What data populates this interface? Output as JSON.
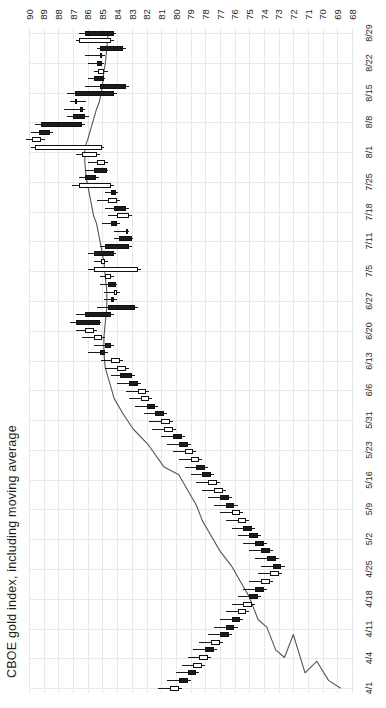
{
  "chart": {
    "title": "CBOE gold index, including moving average",
    "orientation": "rotated-90",
    "axis_line_color": "#e9e9e9",
    "candle_up_color": "#ffffff",
    "candle_down_color": "#1b1b1b",
    "candle_border_color": "#111111",
    "ma_line_color": "#555555"
  },
  "chart_data": {
    "type": "line",
    "subtype": "candlestick-with-moving-average",
    "title": "CBOE gold index, including moving average",
    "xlabel": "",
    "ylabel": "",
    "grid": true,
    "legend": "none",
    "price_axis": {
      "position": "top",
      "direction": "descending-left-to-right",
      "min": 68,
      "max": 90,
      "ticks": [
        90,
        89,
        88,
        87,
        86,
        85,
        84,
        83,
        82,
        81,
        80,
        79,
        78,
        77,
        76,
        75,
        74,
        73,
        72,
        71,
        70,
        69,
        68
      ]
    },
    "date_axis": {
      "position": "right",
      "direction": "descending-top-to-bottom",
      "ticks": [
        "8/29",
        "8/22",
        "8/15",
        "8/8",
        "8/1",
        "7/25",
        "7/18",
        "7/11",
        "7/5",
        "6/27",
        "6/20",
        "6/13",
        "6/6",
        "5/31",
        "5/23",
        "5/16",
        "5/9",
        "5/2",
        "4/25",
        "4/18",
        "4/11",
        "4/4",
        "4/1"
      ]
    },
    "ohlc": [
      {
        "date": "8/29",
        "open": 86.2,
        "high": 86.6,
        "low": 84.1,
        "close": 84.2,
        "dir": "down"
      },
      {
        "date": "8/28",
        "open": 84.4,
        "high": 86.8,
        "low": 84.2,
        "close": 86.6,
        "dir": "up"
      },
      {
        "date": "8/27",
        "open": 85.2,
        "high": 85.4,
        "low": 83.4,
        "close": 83.6,
        "dir": "down"
      },
      {
        "date": "8/26",
        "open": 85.1,
        "high": 86.2,
        "low": 84.8,
        "close": 85.2,
        "dir": "down"
      },
      {
        "date": "8/25",
        "open": 85.4,
        "high": 86.0,
        "low": 84.9,
        "close": 85.0,
        "dir": "down"
      },
      {
        "date": "8/22",
        "open": 84.9,
        "high": 85.6,
        "low": 84.6,
        "close": 85.3,
        "dir": "up"
      },
      {
        "date": "8/21",
        "open": 85.6,
        "high": 86.0,
        "low": 84.8,
        "close": 84.9,
        "dir": "down"
      },
      {
        "date": "8/20",
        "open": 85.2,
        "high": 86.2,
        "low": 83.2,
        "close": 83.4,
        "dir": "down"
      },
      {
        "date": "8/19",
        "open": 86.9,
        "high": 87.4,
        "low": 84.0,
        "close": 84.2,
        "dir": "down"
      },
      {
        "date": "8/18",
        "open": 86.8,
        "high": 87.2,
        "low": 86.1,
        "close": 86.9,
        "dir": "up"
      },
      {
        "date": "8/15",
        "open": 86.4,
        "high": 87.6,
        "low": 86.2,
        "close": 86.5,
        "dir": "down"
      },
      {
        "date": "8/14",
        "open": 87.0,
        "high": 87.4,
        "low": 85.9,
        "close": 86.2,
        "dir": "down"
      },
      {
        "date": "8/13",
        "open": 89.2,
        "high": 89.6,
        "low": 86.2,
        "close": 86.4,
        "dir": "down"
      },
      {
        "date": "8/12",
        "open": 89.3,
        "high": 89.9,
        "low": 88.4,
        "close": 88.6,
        "dir": "down"
      },
      {
        "date": "8/11",
        "open": 89.8,
        "high": 90.2,
        "low": 88.9,
        "close": 89.2,
        "dir": "up"
      },
      {
        "date": "8/8",
        "open": 89.6,
        "high": 89.9,
        "low": 84.9,
        "close": 85.0,
        "dir": "up"
      },
      {
        "date": "8/7",
        "open": 86.4,
        "high": 86.8,
        "low": 85.2,
        "close": 85.4,
        "dir": "up"
      },
      {
        "date": "8/6",
        "open": 85.4,
        "high": 86.0,
        "low": 84.6,
        "close": 84.8,
        "dir": "up"
      },
      {
        "date": "8/5",
        "open": 85.6,
        "high": 86.2,
        "low": 84.6,
        "close": 84.7,
        "dir": "down"
      },
      {
        "date": "8/4",
        "open": 86.2,
        "high": 86.6,
        "low": 85.2,
        "close": 85.4,
        "dir": "down"
      },
      {
        "date": "8/1",
        "open": 86.6,
        "high": 87.1,
        "low": 84.2,
        "close": 84.4,
        "dir": "up"
      },
      {
        "date": "7/31",
        "open": 84.4,
        "high": 84.8,
        "low": 83.9,
        "close": 84.1,
        "dir": "down"
      },
      {
        "date": "7/30",
        "open": 84.6,
        "high": 85.4,
        "low": 83.8,
        "close": 84.0,
        "dir": "up"
      },
      {
        "date": "7/29",
        "open": 84.2,
        "high": 84.8,
        "low": 83.2,
        "close": 83.4,
        "dir": "down"
      },
      {
        "date": "7/28",
        "open": 84.0,
        "high": 84.6,
        "low": 83.0,
        "close": 83.2,
        "dir": "up"
      },
      {
        "date": "7/25",
        "open": 84.4,
        "high": 85.0,
        "low": 83.8,
        "close": 84.0,
        "dir": "down"
      },
      {
        "date": "7/24",
        "open": 83.4,
        "high": 84.2,
        "low": 83.2,
        "close": 83.4,
        "dir": "up"
      },
      {
        "date": "7/23",
        "open": 83.9,
        "high": 84.2,
        "low": 82.9,
        "close": 83.0,
        "dir": "down"
      },
      {
        "date": "7/22",
        "open": 84.8,
        "high": 85.2,
        "low": 83.0,
        "close": 83.2,
        "dir": "down"
      },
      {
        "date": "7/21",
        "open": 85.6,
        "high": 86.0,
        "low": 84.1,
        "close": 84.2,
        "dir": "down"
      },
      {
        "date": "7/18",
        "open": 85.1,
        "high": 85.6,
        "low": 84.6,
        "close": 84.8,
        "dir": "up"
      },
      {
        "date": "7/17",
        "open": 85.6,
        "high": 86.0,
        "low": 82.4,
        "close": 82.6,
        "dir": "up"
      },
      {
        "date": "7/16",
        "open": 84.8,
        "high": 85.2,
        "low": 84.2,
        "close": 84.4,
        "dir": "up"
      },
      {
        "date": "7/15",
        "open": 84.6,
        "high": 85.2,
        "low": 84.0,
        "close": 84.1,
        "dir": "down"
      },
      {
        "date": "7/11",
        "open": 84.2,
        "high": 84.9,
        "low": 83.8,
        "close": 84.0,
        "dir": "up"
      },
      {
        "date": "7/10",
        "open": 84.4,
        "high": 84.9,
        "low": 84.0,
        "close": 84.2,
        "dir": "down"
      },
      {
        "date": "7/9",
        "open": 84.6,
        "high": 85.4,
        "low": 82.6,
        "close": 82.8,
        "dir": "down"
      },
      {
        "date": "7/8",
        "open": 86.2,
        "high": 86.8,
        "low": 84.2,
        "close": 84.4,
        "dir": "down"
      },
      {
        "date": "7/5",
        "open": 86.8,
        "high": 87.2,
        "low": 85.1,
        "close": 85.2,
        "dir": "down"
      },
      {
        "date": "7/3",
        "open": 86.2,
        "high": 86.8,
        "low": 85.4,
        "close": 85.6,
        "dir": "up"
      },
      {
        "date": "7/2",
        "open": 85.6,
        "high": 86.4,
        "low": 84.8,
        "close": 85.0,
        "dir": "up"
      },
      {
        "date": "7/1",
        "open": 84.8,
        "high": 85.6,
        "low": 84.2,
        "close": 84.4,
        "dir": "down"
      },
      {
        "date": "6/27",
        "open": 85.2,
        "high": 86.0,
        "low": 84.6,
        "close": 84.8,
        "dir": "down"
      },
      {
        "date": "6/26",
        "open": 84.4,
        "high": 85.1,
        "low": 83.6,
        "close": 83.8,
        "dir": "up"
      },
      {
        "date": "6/25",
        "open": 84.0,
        "high": 84.8,
        "low": 83.2,
        "close": 83.4,
        "dir": "up"
      },
      {
        "date": "6/24",
        "open": 83.8,
        "high": 84.4,
        "low": 82.8,
        "close": 83.0,
        "dir": "down"
      },
      {
        "date": "6/20",
        "open": 83.2,
        "high": 84.0,
        "low": 82.4,
        "close": 82.6,
        "dir": "down"
      },
      {
        "date": "6/19",
        "open": 82.6,
        "high": 83.4,
        "low": 81.8,
        "close": 82.0,
        "dir": "up"
      },
      {
        "date": "6/18",
        "open": 82.4,
        "high": 83.2,
        "low": 81.6,
        "close": 81.8,
        "dir": "up"
      },
      {
        "date": "6/17",
        "open": 82.0,
        "high": 82.8,
        "low": 81.2,
        "close": 81.4,
        "dir": "down"
      },
      {
        "date": "6/13",
        "open": 81.4,
        "high": 82.2,
        "low": 80.6,
        "close": 80.8,
        "dir": "down"
      },
      {
        "date": "6/12",
        "open": 81.0,
        "high": 81.8,
        "low": 80.2,
        "close": 80.4,
        "dir": "up"
      },
      {
        "date": "6/11",
        "open": 80.8,
        "high": 81.6,
        "low": 80.0,
        "close": 80.2,
        "dir": "up"
      },
      {
        "date": "6/10",
        "open": 80.2,
        "high": 81.0,
        "low": 79.4,
        "close": 79.6,
        "dir": "down"
      },
      {
        "date": "6/6",
        "open": 79.8,
        "high": 80.6,
        "low": 79.0,
        "close": 79.2,
        "dir": "down"
      },
      {
        "date": "6/5",
        "open": 79.4,
        "high": 80.2,
        "low": 78.6,
        "close": 78.8,
        "dir": "up"
      },
      {
        "date": "6/4",
        "open": 79.0,
        "high": 79.8,
        "low": 78.2,
        "close": 78.4,
        "dir": "up"
      },
      {
        "date": "6/3",
        "open": 78.6,
        "high": 79.4,
        "low": 77.8,
        "close": 78.0,
        "dir": "down"
      },
      {
        "date": "5/31",
        "open": 78.2,
        "high": 79.0,
        "low": 77.4,
        "close": 77.6,
        "dir": "down"
      },
      {
        "date": "5/30",
        "open": 77.8,
        "high": 78.6,
        "low": 77.0,
        "close": 77.2,
        "dir": "up"
      },
      {
        "date": "5/29",
        "open": 77.4,
        "high": 78.2,
        "low": 76.6,
        "close": 76.8,
        "dir": "up"
      },
      {
        "date": "5/28",
        "open": 77.0,
        "high": 77.8,
        "low": 76.2,
        "close": 76.4,
        "dir": "down"
      },
      {
        "date": "5/23",
        "open": 76.6,
        "high": 77.4,
        "low": 75.8,
        "close": 76.0,
        "dir": "down"
      },
      {
        "date": "5/22",
        "open": 76.2,
        "high": 77.0,
        "low": 75.4,
        "close": 75.6,
        "dir": "up"
      },
      {
        "date": "5/21",
        "open": 75.8,
        "high": 76.6,
        "low": 75.0,
        "close": 75.2,
        "dir": "up"
      },
      {
        "date": "5/20",
        "open": 75.4,
        "high": 76.2,
        "low": 74.6,
        "close": 74.8,
        "dir": "down"
      },
      {
        "date": "5/16",
        "open": 75.0,
        "high": 75.8,
        "low": 74.2,
        "close": 74.4,
        "dir": "down"
      },
      {
        "date": "5/15",
        "open": 74.6,
        "high": 75.4,
        "low": 73.8,
        "close": 74.0,
        "dir": "down"
      },
      {
        "date": "5/14",
        "open": 74.2,
        "high": 75.0,
        "low": 73.4,
        "close": 73.6,
        "dir": "down"
      },
      {
        "date": "5/13",
        "open": 73.8,
        "high": 74.6,
        "low": 73.0,
        "close": 73.2,
        "dir": "down"
      },
      {
        "date": "5/9",
        "open": 73.4,
        "high": 74.2,
        "low": 72.6,
        "close": 72.8,
        "dir": "down"
      },
      {
        "date": "5/8",
        "open": 73.6,
        "high": 74.4,
        "low": 72.8,
        "close": 73.0,
        "dir": "up"
      },
      {
        "date": "5/7",
        "open": 74.2,
        "high": 75.0,
        "low": 73.4,
        "close": 73.6,
        "dir": "up"
      },
      {
        "date": "5/6",
        "open": 74.6,
        "high": 75.4,
        "low": 73.8,
        "close": 74.0,
        "dir": "down"
      },
      {
        "date": "5/2",
        "open": 75.0,
        "high": 75.8,
        "low": 74.2,
        "close": 74.4,
        "dir": "down"
      },
      {
        "date": "5/1",
        "open": 75.4,
        "high": 76.2,
        "low": 74.6,
        "close": 74.8,
        "dir": "up"
      },
      {
        "date": "4/30",
        "open": 75.8,
        "high": 76.6,
        "low": 75.0,
        "close": 75.2,
        "dir": "up"
      },
      {
        "date": "4/29",
        "open": 76.2,
        "high": 77.0,
        "low": 75.4,
        "close": 75.6,
        "dir": "down"
      },
      {
        "date": "4/25",
        "open": 76.6,
        "high": 77.4,
        "low": 75.8,
        "close": 76.0,
        "dir": "down"
      },
      {
        "date": "4/24",
        "open": 77.0,
        "high": 77.8,
        "low": 76.2,
        "close": 76.4,
        "dir": "down"
      },
      {
        "date": "4/23",
        "open": 77.6,
        "high": 78.4,
        "low": 76.8,
        "close": 77.0,
        "dir": "up"
      },
      {
        "date": "4/22",
        "open": 78.0,
        "high": 78.8,
        "low": 77.2,
        "close": 77.4,
        "dir": "down"
      },
      {
        "date": "4/18",
        "open": 78.4,
        "high": 79.2,
        "low": 77.6,
        "close": 77.8,
        "dir": "up"
      },
      {
        "date": "4/17",
        "open": 78.8,
        "high": 79.6,
        "low": 78.0,
        "close": 78.2,
        "dir": "up"
      },
      {
        "date": "4/11",
        "open": 79.2,
        "high": 80.0,
        "low": 78.4,
        "close": 78.6,
        "dir": "down"
      },
      {
        "date": "4/4",
        "open": 79.8,
        "high": 80.6,
        "low": 79.0,
        "close": 79.2,
        "dir": "down"
      },
      {
        "date": "4/1",
        "open": 80.4,
        "high": 81.2,
        "low": 79.6,
        "close": 79.8,
        "dir": "up"
      }
    ],
    "moving_average": [
      {
        "date": "8/29",
        "value": 84.6
      },
      {
        "date": "8/27",
        "value": 84.7
      },
      {
        "date": "8/25",
        "value": 84.8
      },
      {
        "date": "8/22",
        "value": 84.9
      },
      {
        "date": "8/20",
        "value": 85.0
      },
      {
        "date": "8/18",
        "value": 85.2
      },
      {
        "date": "8/15",
        "value": 85.4
      },
      {
        "date": "8/13",
        "value": 85.7
      },
      {
        "date": "8/11",
        "value": 86.0
      },
      {
        "date": "8/8",
        "value": 86.2
      },
      {
        "date": "8/6",
        "value": 86.2
      },
      {
        "date": "8/4",
        "value": 86.1
      },
      {
        "date": "8/1",
        "value": 86.0
      },
      {
        "date": "7/30",
        "value": 85.8
      },
      {
        "date": "7/28",
        "value": 85.6
      },
      {
        "date": "7/25",
        "value": 85.4
      },
      {
        "date": "7/23",
        "value": 85.2
      },
      {
        "date": "7/21",
        "value": 85.0
      },
      {
        "date": "7/18",
        "value": 84.9
      },
      {
        "date": "7/16",
        "value": 84.8
      },
      {
        "date": "7/11",
        "value": 84.7
      },
      {
        "date": "7/9",
        "value": 84.7
      },
      {
        "date": "7/5",
        "value": 84.8
      },
      {
        "date": "7/2",
        "value": 84.9
      },
      {
        "date": "6/27",
        "value": 84.9
      },
      {
        "date": "6/25",
        "value": 84.8
      },
      {
        "date": "6/20",
        "value": 84.5
      },
      {
        "date": "6/18",
        "value": 84.2
      },
      {
        "date": "6/13",
        "value": 83.6
      },
      {
        "date": "6/11",
        "value": 82.9
      },
      {
        "date": "6/6",
        "value": 81.9
      },
      {
        "date": "6/3",
        "value": 80.8
      },
      {
        "date": "5/31",
        "value": 79.8
      },
      {
        "date": "5/29",
        "value": 79.2
      },
      {
        "date": "5/23",
        "value": 78.6
      },
      {
        "date": "5/21",
        "value": 78.2
      },
      {
        "date": "5/16",
        "value": 77.6
      },
      {
        "date": "5/14",
        "value": 77.0
      },
      {
        "date": "5/9",
        "value": 76.2
      },
      {
        "date": "5/7",
        "value": 75.6
      },
      {
        "date": "5/2",
        "value": 75.0
      },
      {
        "date": "4/29",
        "value": 74.4
      },
      {
        "date": "4/25",
        "value": 73.8
      },
      {
        "date": "4/22",
        "value": 73.2
      },
      {
        "date": "4/18",
        "value": 72.6
      },
      {
        "date": "4/15",
        "value": 72.0
      },
      {
        "date": "4/11",
        "value": 71.2
      },
      {
        "date": "4/8",
        "value": 70.4
      },
      {
        "date": "4/4",
        "value": 69.6
      },
      {
        "date": "4/1",
        "value": 68.8
      }
    ]
  }
}
